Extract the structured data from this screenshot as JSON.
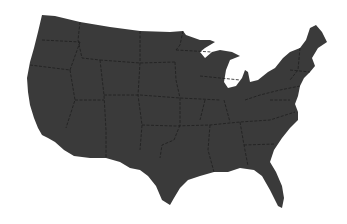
{
  "map": {
    "title": "",
    "subject": "contiguous-united-states",
    "fill_color": "#3a3a3a",
    "border_color": "#1e1e1e",
    "background": "#ffffff"
  }
}
